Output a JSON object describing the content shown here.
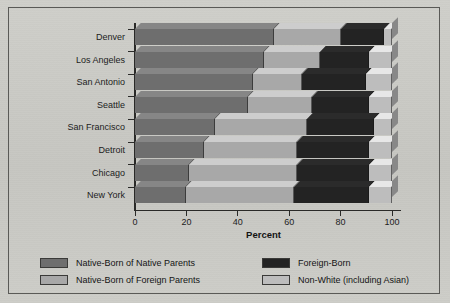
{
  "chart_data": {
    "type": "bar",
    "orientation": "horizontal",
    "stacked": true,
    "stack_mode": "percent",
    "title": "",
    "xlabel": "Percent",
    "ylabel": "",
    "xlim": [
      0,
      100
    ],
    "xticks": [
      0,
      20,
      40,
      60,
      80,
      100
    ],
    "xtick_labels": [
      "0",
      "20",
      "40",
      "60",
      "80",
      "100"
    ],
    "grid": false,
    "legend_position": "bottom",
    "categories": [
      "Denver",
      "Los Angeles",
      "San Antonio",
      "Seattle",
      "San Francisco",
      "Detroit",
      "Chicago",
      "New York"
    ],
    "series": [
      {
        "name": "Native-Born of Native Parents",
        "color": "#6e6e6e",
        "values": [
          54,
          50,
          46,
          44,
          31,
          27,
          21,
          20
        ]
      },
      {
        "name": "Native-Born of Foreign Parents",
        "color": "#a8a8a8",
        "values": [
          26,
          22,
          19,
          25,
          36,
          36,
          42,
          42
        ]
      },
      {
        "name": "Foreign-Born",
        "color": "#232323",
        "values": [
          17,
          19,
          25,
          22,
          26,
          28,
          28,
          29
        ]
      },
      {
        "name": "Non-White (including Asian)",
        "color": "#bdbdbd",
        "values": [
          3,
          9,
          10,
          9,
          7,
          9,
          9,
          9
        ]
      }
    ]
  },
  "axis": {
    "x_title": "Percent"
  },
  "legend": {
    "entries": [
      {
        "label": "Native-Born of Native Parents",
        "color": "#6e6e6e"
      },
      {
        "label": "Native-Born of Foreign Parents",
        "color": "#a8a8a8"
      },
      {
        "label": "Foreign-Born",
        "color": "#232323"
      },
      {
        "label": "Non-White (including Asian)",
        "color": "#bdbdbd"
      }
    ]
  },
  "style": {
    "background": "#c9c9c4",
    "frame_color": "#5a5a57",
    "axis_color": "#2a2a28",
    "text_color": "#1c1c1c"
  }
}
